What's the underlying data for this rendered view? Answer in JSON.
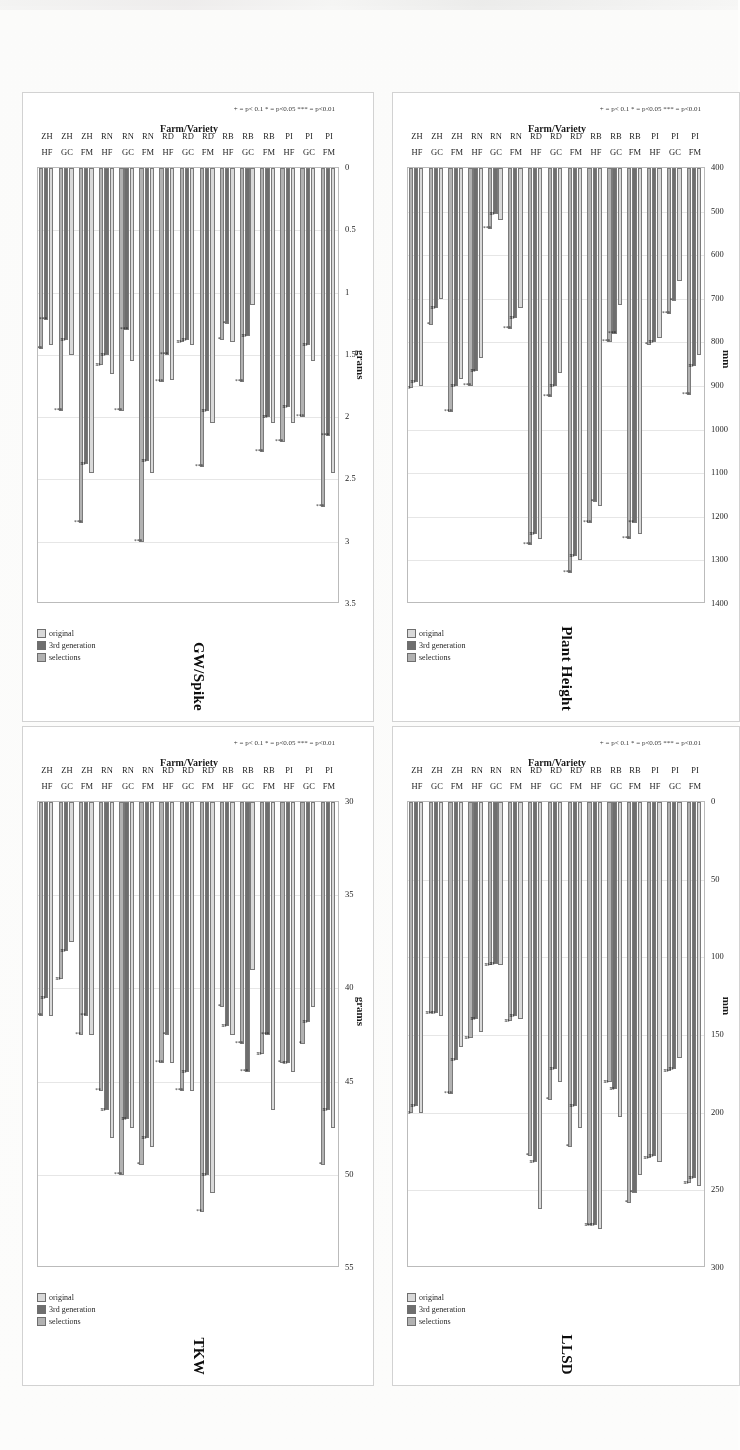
{
  "figure": {
    "series": [
      {
        "key": "original",
        "label": "original",
        "color": "#d6d6d6"
      },
      {
        "key": "third_generation",
        "label": "3rd generation",
        "color": "#6f6f6f"
      },
      {
        "key": "selections",
        "label": "selections",
        "color": "#b0b0b0"
      }
    ],
    "categories": [
      {
        "farm": "PI",
        "variety": "FM"
      },
      {
        "farm": "PI",
        "variety": "GC"
      },
      {
        "farm": "PI",
        "variety": "HF"
      },
      {
        "farm": "RB",
        "variety": "FM"
      },
      {
        "farm": "RB",
        "variety": "GC"
      },
      {
        "farm": "RB",
        "variety": "HF"
      },
      {
        "farm": "RD",
        "variety": "FM"
      },
      {
        "farm": "RD",
        "variety": "GC"
      },
      {
        "farm": "RD",
        "variety": "HF"
      },
      {
        "farm": "RN",
        "variety": "FM"
      },
      {
        "farm": "RN",
        "variety": "GC"
      },
      {
        "farm": "RN",
        "variety": "HF"
      },
      {
        "farm": "ZH",
        "variety": "FM"
      },
      {
        "farm": "ZH",
        "variety": "GC"
      },
      {
        "farm": "ZH",
        "variety": "HF"
      }
    ],
    "category_axis_label": "Farm/Variety",
    "significance_note": "+ = p< 0.1   * = p<0.05   *** = p<0.01",
    "legend_position": "bottom-right"
  },
  "chart_data": [
    {
      "id": "plant_height",
      "type": "bar",
      "orientation": "horizontal",
      "title": "Plant Height",
      "ylabel": "Farm/Variety",
      "xlabel": "mm",
      "unit": "mm",
      "xlim": [
        400,
        1400
      ],
      "xticks": [
        400,
        500,
        600,
        700,
        800,
        900,
        1000,
        1100,
        1200,
        1300,
        1400
      ],
      "grid": true,
      "categories": [
        "PI FM",
        "PI GC",
        "PI HF",
        "RB FM",
        "RB GC",
        "RB HF",
        "RD FM",
        "RD GC",
        "RD HF",
        "RN FM",
        "RN GC",
        "RN HF",
        "ZH FM",
        "ZH GC",
        "ZH HF"
      ],
      "series": [
        {
          "name": "original",
          "values": [
            830,
            660,
            790,
            1240,
            715,
            1175,
            1300,
            870,
            1250,
            720,
            520,
            835,
            885,
            700,
            900
          ]
        },
        {
          "name": "3rd generation",
          "values": [
            855,
            705,
            800,
            1215,
            780,
            1165,
            1290,
            900,
            1240,
            745,
            505,
            865,
            900,
            720,
            890
          ]
        },
        {
          "name": "selections",
          "values": [
            920,
            735,
            805,
            1250,
            800,
            1215,
            1330,
            925,
            1265,
            770,
            540,
            900,
            960,
            760,
            905
          ]
        }
      ],
      "significance": [
        {
          "marks": [
            "ns",
            "***"
          ]
        },
        {
          "marks": [
            "*",
            "***"
          ]
        },
        {
          "marks": [
            "ns",
            "*"
          ]
        },
        {
          "marks": [
            "**",
            "***"
          ]
        },
        {
          "marks": [
            "***",
            "***"
          ]
        },
        {
          "marks": [
            "*",
            "***"
          ]
        },
        {
          "marks": [
            "ns",
            "***"
          ]
        },
        {
          "marks": [
            "ns",
            "***"
          ]
        },
        {
          "marks": [
            "ns",
            "***"
          ]
        },
        {
          "marks": [
            "ns",
            "***"
          ]
        },
        {
          "marks": [
            "ns",
            "***"
          ]
        },
        {
          "marks": [
            "ns",
            "***"
          ]
        },
        {
          "marks": [
            "ns",
            "***"
          ]
        },
        {
          "marks": [
            "ns",
            "*"
          ]
        },
        {
          "marks": [
            "ns",
            "ns"
          ]
        }
      ]
    },
    {
      "id": "llsd",
      "type": "bar",
      "orientation": "horizontal",
      "title": "LLSD",
      "ylabel": "Farm/Variety",
      "xlabel": "mm",
      "unit": "mm",
      "xlim": [
        0,
        300
      ],
      "xticks": [
        0,
        50,
        100,
        150,
        200,
        250,
        300
      ],
      "grid": true,
      "categories": [
        "PI FM",
        "PI GC",
        "PI HF",
        "RB FM",
        "RB GC",
        "RB HF",
        "RD FM",
        "RD GC",
        "RD HF",
        "RN FM",
        "RN GC",
        "RN HF",
        "ZH FM",
        "ZH GC",
        "ZH HF"
      ],
      "series": [
        {
          "name": "original",
          "values": [
            247,
            165,
            232,
            240,
            203,
            275,
            210,
            180,
            262,
            140,
            105,
            148,
            158,
            138,
            200
          ]
        },
        {
          "name": "3rd generation",
          "values": [
            242,
            172,
            228,
            252,
            185,
            272,
            196,
            172,
            232,
            138,
            104,
            140,
            166,
            136,
            196
          ]
        },
        {
          "name": "selections",
          "values": [
            245,
            173,
            229,
            258,
            180,
            272,
            222,
            192,
            228,
            141,
            105,
            152,
            188,
            136,
            200
          ]
        }
      ],
      "significance": [
        {
          "marks": [
            "ns",
            "ns"
          ]
        },
        {
          "marks": [
            "ns",
            "ns"
          ]
        },
        {
          "marks": [
            "ns",
            "ns"
          ]
        },
        {
          "marks": [
            "*",
            "*"
          ]
        },
        {
          "marks": [
            "ns",
            "ns"
          ]
        },
        {
          "marks": [
            "ns",
            "ns"
          ]
        },
        {
          "marks": [
            "ns",
            "*"
          ]
        },
        {
          "marks": [
            "ns",
            "*"
          ]
        },
        {
          "marks": [
            "ns",
            "*"
          ]
        },
        {
          "marks": [
            "ns",
            "ns"
          ]
        },
        {
          "marks": [
            "ns",
            "ns"
          ]
        },
        {
          "marks": [
            "ns",
            "ns"
          ]
        },
        {
          "marks": [
            "ns",
            "***"
          ]
        },
        {
          "marks": [
            "ns",
            "ns"
          ]
        },
        {
          "marks": [
            "ns",
            "ns"
          ]
        }
      ]
    },
    {
      "id": "gw_spike",
      "type": "bar",
      "orientation": "horizontal",
      "title": "GW/Spike",
      "ylabel": "Farm/Variety",
      "xlabel": "grams",
      "unit": "grams",
      "xlim": [
        0,
        3.5
      ],
      "xticks": [
        0,
        0.5,
        1,
        1.5,
        2,
        2.5,
        3,
        3.5
      ],
      "grid": true,
      "categories": [
        "PI FM",
        "PI GC",
        "PI HF",
        "RB FM",
        "RB GC",
        "RB HF",
        "RD FM",
        "RD GC",
        "RD HF",
        "RN FM",
        "RN GC",
        "RN HF",
        "ZH FM",
        "ZH GC",
        "ZH HF"
      ],
      "series": [
        {
          "name": "original",
          "values": [
            2.45,
            1.55,
            2.05,
            2.05,
            1.1,
            1.4,
            2.05,
            1.42,
            1.7,
            2.45,
            1.55,
            1.65,
            2.45,
            1.5,
            1.42
          ]
        },
        {
          "name": "3rd generation",
          "values": [
            2.15,
            1.42,
            1.92,
            2.0,
            1.35,
            1.25,
            1.95,
            1.38,
            1.5,
            2.35,
            1.3,
            1.5,
            2.38,
            1.38,
            1.22
          ]
        },
        {
          "name": "selections",
          "values": [
            2.72,
            2.0,
            2.2,
            2.28,
            1.72,
            1.38,
            2.4,
            1.4,
            1.72,
            3.0,
            1.95,
            1.58,
            2.85,
            1.95,
            1.45
          ]
        }
      ],
      "significance": [
        {
          "marks": [
            "***",
            "***"
          ]
        },
        {
          "marks": [
            "ns",
            "***"
          ]
        },
        {
          "marks": [
            "ns",
            "***"
          ]
        },
        {
          "marks": [
            "ns",
            "***"
          ]
        },
        {
          "marks": [
            "ns",
            "***"
          ]
        },
        {
          "marks": [
            "*",
            "*"
          ]
        },
        {
          "marks": [
            "ns",
            "***"
          ]
        },
        {
          "marks": [
            "ns",
            "ns"
          ]
        },
        {
          "marks": [
            "***",
            "***"
          ]
        },
        {
          "marks": [
            "ns",
            "***"
          ]
        },
        {
          "marks": [
            "***",
            "***"
          ]
        },
        {
          "marks": [
            "ns",
            "ns"
          ]
        },
        {
          "marks": [
            "ns",
            "***"
          ]
        },
        {
          "marks": [
            "ns",
            "***"
          ]
        },
        {
          "marks": [
            "***",
            "***"
          ]
        }
      ]
    },
    {
      "id": "tkw",
      "type": "bar",
      "orientation": "horizontal",
      "title": "TKW",
      "ylabel": "Farm/Variety",
      "xlabel": "grams",
      "unit": "grams",
      "xlim": [
        30,
        55
      ],
      "xticks": [
        30,
        35,
        40,
        45,
        50,
        55
      ],
      "grid": true,
      "categories": [
        "PI FM",
        "PI GC",
        "PI HF",
        "RB FM",
        "RB GC",
        "RB HF",
        "RD FM",
        "RD GC",
        "RD HF",
        "RN FM",
        "RN GC",
        "RN HF",
        "ZH FM",
        "ZH GC",
        "ZH HF"
      ],
      "series": [
        {
          "name": "original",
          "values": [
            47.5,
            41.0,
            44.5,
            46.5,
            39.0,
            42.5,
            51.0,
            45.5,
            44.0,
            48.5,
            47.5,
            48.0,
            42.5,
            37.5,
            41.5
          ]
        },
        {
          "name": "3rd generation",
          "values": [
            46.5,
            41.8,
            44.0,
            42.5,
            44.5,
            42.0,
            50.0,
            44.5,
            42.5,
            48.0,
            47.0,
            46.5,
            41.5,
            38.0,
            40.5
          ]
        },
        {
          "name": "selections",
          "values": [
            49.5,
            43.0,
            44.0,
            43.5,
            43.0,
            41.0,
            52.0,
            45.5,
            44.0,
            49.5,
            50.0,
            45.5,
            42.5,
            39.5,
            41.5
          ]
        }
      ],
      "significance": [
        {
          "marks": [
            "ns",
            "*"
          ]
        },
        {
          "marks": [
            "ns",
            "*"
          ]
        },
        {
          "marks": [
            "ns",
            "*"
          ]
        },
        {
          "marks": [
            "***",
            "ns"
          ]
        },
        {
          "marks": [
            "***",
            "***"
          ]
        },
        {
          "marks": [
            "ns",
            "*"
          ]
        },
        {
          "marks": [
            "ns",
            "**"
          ]
        },
        {
          "marks": [
            "ns",
            "***"
          ]
        },
        {
          "marks": [
            "*",
            "***"
          ]
        },
        {
          "marks": [
            "ns",
            "*"
          ]
        },
        {
          "marks": [
            "ns",
            "***"
          ]
        },
        {
          "marks": [
            "ns",
            "**"
          ]
        },
        {
          "marks": [
            "**",
            "**"
          ]
        },
        {
          "marks": [
            "ns",
            "ns"
          ]
        },
        {
          "marks": [
            "ns",
            "***"
          ]
        }
      ]
    }
  ]
}
